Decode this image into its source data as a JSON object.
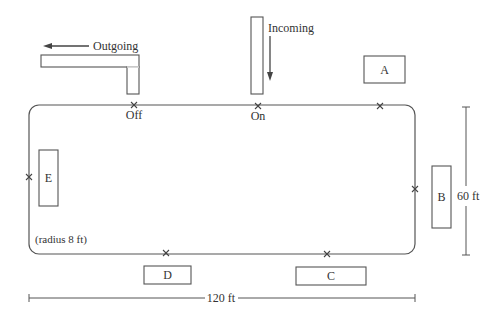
{
  "diagram": {
    "type": "rail-yard layout",
    "track": {
      "shape": "rounded rectangle loop",
      "note": "(radius 8 ft)",
      "width_label": "120 ft",
      "height_label": "60 ft"
    },
    "spurs": {
      "outgoing": {
        "label": "Outgoing",
        "arrow": "left"
      },
      "incoming": {
        "label": "Incoming",
        "arrow": "down"
      }
    },
    "switches": {
      "off": "Off",
      "on": "On"
    },
    "stations": [
      {
        "id": "A",
        "label": "A"
      },
      {
        "id": "B",
        "label": "B"
      },
      {
        "id": "C",
        "label": "C"
      },
      {
        "id": "D",
        "label": "D"
      },
      {
        "id": "E",
        "label": "E"
      }
    ],
    "markers": "x",
    "colors": {
      "line": "#555555",
      "text": "#333333",
      "background": "#ffffff"
    }
  }
}
